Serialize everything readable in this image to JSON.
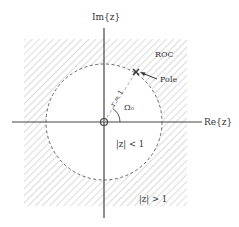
{
  "diagram": {
    "type": "z-plane region of convergence",
    "axes": {
      "imag_label": "Im{z}",
      "real_label": "Re{z}"
    },
    "unit_circle": {
      "radius_label": "r = 1",
      "angle_label": "Ω₀"
    },
    "labels": {
      "roc": "ROC",
      "pole": "Pole",
      "inside": "|z| < 1",
      "outside": "|z| > 1"
    },
    "colors": {
      "axis": "#444444",
      "hatch": "#cfcfcf",
      "circle": "#666666",
      "text": "#333333"
    }
  }
}
